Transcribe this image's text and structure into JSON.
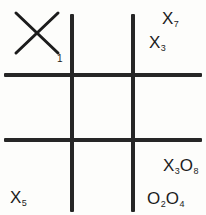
{
  "diagram": {
    "type": "tic-tac-toe-grid",
    "rows": 3,
    "columns": 3,
    "ink_color": "#1c1c1c",
    "background_color": "#fdfdfb",
    "cells": [
      {
        "id": "top-left",
        "row": 0,
        "column": 0,
        "big_glyph": "X",
        "big_glyph_label": "1",
        "marks": []
      },
      {
        "id": "top-middle",
        "row": 0,
        "column": 1,
        "big_glyph": null,
        "big_glyph_label": null,
        "marks": [
          {
            "symbol": "X",
            "subscript": "7"
          },
          {
            "symbol": "X",
            "subscript": "3"
          }
        ]
      },
      {
        "id": "top-right",
        "row": 0,
        "column": 2,
        "big_glyph": null,
        "big_glyph_label": null,
        "marks": [
          {
            "symbol": "X",
            "subscript": "7"
          },
          {
            "symbol": "O",
            "subscript": "8"
          }
        ]
      },
      {
        "id": "middle-left",
        "row": 1,
        "column": 0,
        "big_glyph": null,
        "big_glyph_label": null,
        "marks": [
          {
            "symbol": "X",
            "subscript": "5"
          }
        ]
      },
      {
        "id": "middle-middle",
        "row": 1,
        "column": 1,
        "big_glyph": null,
        "big_glyph_label": null,
        "marks": [
          {
            "symbol": "X",
            "subscript": "3"
          },
          {
            "symbol": "O",
            "subscript": "8"
          },
          {
            "symbol": "O",
            "subscript": "2"
          },
          {
            "symbol": "O",
            "subscript": "4"
          }
        ]
      },
      {
        "id": "middle-right",
        "row": 1,
        "column": 2,
        "big_glyph": null,
        "big_glyph_label": null,
        "marks": []
      },
      {
        "id": "bottom-left",
        "row": 2,
        "column": 0,
        "big_glyph": null,
        "big_glyph_label": null,
        "marks": [
          {
            "symbol": "X",
            "subscript": "5"
          },
          {
            "symbol": "O",
            "subscript": "2"
          }
        ]
      },
      {
        "id": "bottom-middle",
        "row": 2,
        "column": 1,
        "big_glyph": null,
        "big_glyph_label": null,
        "marks": [
          {
            "symbol": "O",
            "subscript": "4"
          }
        ]
      },
      {
        "id": "bottom-right",
        "row": 2,
        "column": 2,
        "big_glyph": "O",
        "big_glyph_label": "6",
        "marks": []
      }
    ],
    "labels": {
      "big_x_symbol": "X",
      "big_x_number": "1",
      "big_o_symbol": "O",
      "big_o_number": "6",
      "tm_x7_symbol": "X",
      "tm_x7_sub": "7",
      "tm_x3_symbol": "X",
      "tm_x3_sub": "3",
      "tr_x7_symbol": "X",
      "tr_x7_sub": "7",
      "tr_o8_symbol": "O",
      "tr_o8_sub": "8",
      "ml_x5_symbol": "X",
      "ml_x5_sub": "5",
      "mm_x3_symbol": "X",
      "mm_x3_sub": "3",
      "mm_o8_symbol": "O",
      "mm_o8_sub": "8",
      "mm_o2_symbol": "O",
      "mm_o2_sub": "2",
      "mm_o4_symbol": "O",
      "mm_o4_sub": "4",
      "bl_x5_symbol": "X",
      "bl_x5_sub": "5",
      "bl_o2_symbol": "O",
      "bl_o2_sub": "2",
      "bm_o4_symbol": "O",
      "bm_o4_sub": "4"
    }
  }
}
